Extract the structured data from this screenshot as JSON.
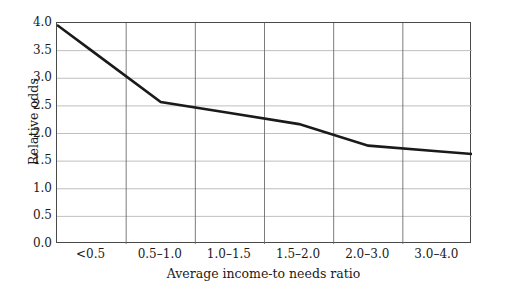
{
  "chart_data": {
    "type": "line",
    "title": "",
    "subtitle": "",
    "xlabel": "Average income-to needs ratio",
    "ylabel": "Relative odds",
    "categories": [
      "<0.5",
      "0.5–1.0",
      "1.0–1.5",
      "1.5–2.0",
      "2.0–3.0",
      "3.0–4.0"
    ],
    "values": [
      3.5,
      2.57,
      2.37,
      2.17,
      1.78,
      1.68
    ],
    "series": [
      {
        "name": "Relative odds",
        "values": [
          3.5,
          2.57,
          2.37,
          2.17,
          1.78,
          1.68
        ]
      }
    ],
    "ylim": [
      0.0,
      4.0
    ],
    "yticks": [
      "0.0",
      "0.5",
      "1.0",
      "1.5",
      "2.0",
      "2.5",
      "3.0",
      "3.5",
      "4.0"
    ],
    "ytick_values": [
      0.0,
      0.5,
      1.0,
      1.5,
      2.0,
      2.5,
      3.0,
      3.5,
      4.0
    ],
    "grid": "both",
    "legend": "none",
    "line_color": "#1a1a1a",
    "grid_color": "#b8b8b8",
    "frame_color": "#4a4a4a",
    "background_color": "#ffffff",
    "markers": "none",
    "annotations": []
  }
}
